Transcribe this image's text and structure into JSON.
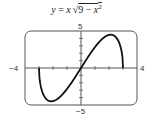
{
  "chart_data": {
    "type": "line",
    "function": "y = x*sqrt(9 - x^2)",
    "xlim": [
      -4,
      4
    ],
    "ylim": [
      -5,
      5
    ],
    "xscale_ticks": 1,
    "yscale_ticks": 1,
    "tick_labels": {
      "x_min": "−4",
      "x_max": "4",
      "y_max": "5",
      "y_min": "−5"
    },
    "domain": [
      -3,
      3
    ],
    "series": [
      {
        "name": "y = x√(9 − x²)",
        "x": [
          -3,
          -2.5,
          -2.12,
          -1.5,
          -1,
          0,
          1,
          1.5,
          2.12,
          2.5,
          3
        ],
        "values": [
          0,
          -4.15,
          -4.5,
          -3.9,
          -2.83,
          0,
          2.83,
          3.9,
          4.5,
          4.15,
          0
        ]
      }
    ],
    "grid": false,
    "legend": "none"
  }
}
